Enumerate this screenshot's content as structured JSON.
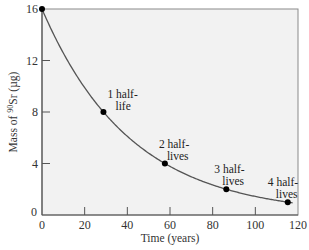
{
  "chart_data": {
    "type": "line",
    "title": "",
    "xlabel": "Time (years)",
    "ylabel": "Mass of 90Sr (µg)",
    "ylabel_parts": {
      "prefix": "Mass of ",
      "superscript": "90",
      "element": "Sr",
      "unit": " (µg)"
    },
    "xlim": [
      0,
      120
    ],
    "ylim": [
      0,
      16
    ],
    "x_ticks": [
      0,
      20,
      40,
      60,
      80,
      100,
      120
    ],
    "y_ticks": [
      0,
      4,
      8,
      12,
      16
    ],
    "grid": false,
    "series": [
      {
        "name": "Decay of 90Sr (half-life 28.8 years)",
        "curve": "exponential decay",
        "x": [
          0,
          28.8,
          57.6,
          86.4,
          115.2
        ],
        "values": [
          16,
          8,
          4,
          2,
          1
        ]
      }
    ],
    "annotations": [
      {
        "text_line1": "1 half-",
        "text_line2": "life",
        "x": 28.8,
        "y": 8
      },
      {
        "text_line1": "2 half-",
        "text_line2": "lives",
        "x": 57.6,
        "y": 4
      },
      {
        "text_line1": "3 half-",
        "text_line2": "lives",
        "x": 86.4,
        "y": 2
      },
      {
        "text_line1": "4 half-",
        "text_line2": "lives",
        "x": 115.2,
        "y": 1
      }
    ]
  }
}
